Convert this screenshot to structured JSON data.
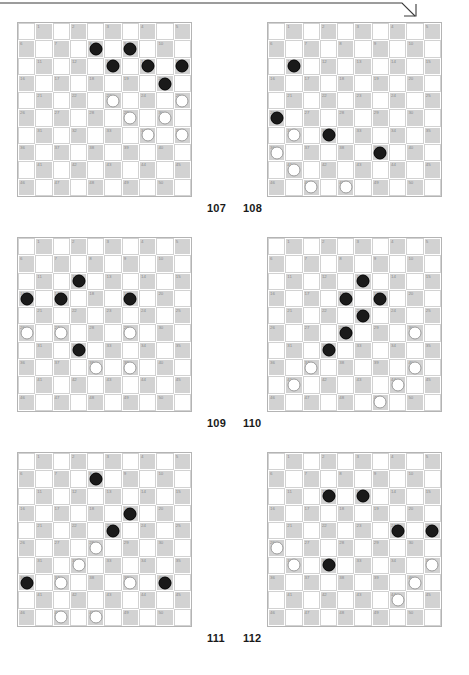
{
  "page": {
    "corner_mark": "page-corner-arrow",
    "board_size": 10,
    "numbered_squares": 50,
    "colors": {
      "dark_square": "#d2d2d2",
      "light_square": "#ffffff",
      "board_border": "#b4b4b4",
      "square_number": "#8a8a8a",
      "black_piece": "#1a1a1a",
      "white_piece": "#ffffff",
      "white_piece_border": "#9a9a9a",
      "caption_text": "#1a1a1a"
    }
  },
  "boards": [
    {
      "id": "board-107",
      "caption": "107",
      "caption_side": "left",
      "row": 1,
      "column": "left",
      "black": [
        8,
        9,
        13,
        14,
        15,
        20
      ],
      "white": [
        23,
        25,
        29,
        30,
        34,
        35
      ]
    },
    {
      "id": "board-108",
      "caption": "108",
      "caption_side": "right",
      "row": 1,
      "column": "right",
      "black": [
        11,
        26,
        32,
        39
      ],
      "white": [
        31,
        36,
        41,
        47,
        48
      ]
    },
    {
      "id": "board-109",
      "caption": "109",
      "caption_side": "left",
      "row": 2,
      "column": "left",
      "black": [
        12,
        16,
        17,
        19,
        32
      ],
      "white": [
        26,
        27,
        29,
        38,
        39
      ]
    },
    {
      "id": "board-110",
      "caption": "110",
      "caption_side": "right",
      "row": 2,
      "column": "right",
      "black": [
        13,
        18,
        19,
        23,
        28,
        32
      ],
      "white": [
        30,
        37,
        40,
        41,
        44,
        49
      ]
    },
    {
      "id": "board-111",
      "caption": "111",
      "caption_side": "left",
      "row": 3,
      "column": "left",
      "black": [
        8,
        19,
        23,
        36,
        40
      ],
      "white": [
        28,
        32,
        37,
        39,
        47,
        48
      ]
    },
    {
      "id": "board-112",
      "caption": "112",
      "caption_side": "right",
      "row": 3,
      "column": "right",
      "black": [
        12,
        13,
        24,
        25,
        32
      ],
      "white": [
        26,
        31,
        35,
        40,
        44
      ]
    }
  ],
  "captions": {
    "row1_left": "107",
    "row1_right": "108",
    "row2_left": "109",
    "row2_right": "110",
    "row3_left": "111",
    "row3_right": "112"
  }
}
